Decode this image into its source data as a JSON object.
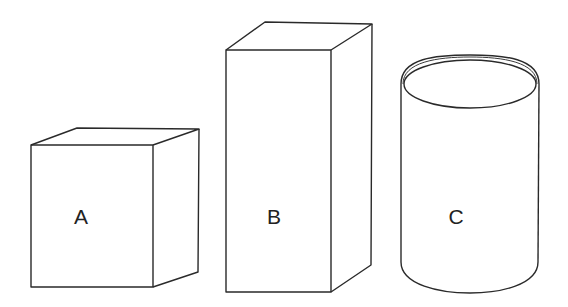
{
  "figure": {
    "shapes": [
      {
        "id": "A",
        "label": "A",
        "type": "cube"
      },
      {
        "id": "B",
        "label": "B",
        "type": "rectangular-prism"
      },
      {
        "id": "C",
        "label": "C",
        "type": "cylinder"
      }
    ],
    "colors": {
      "stroke": "#2a2a2a",
      "background": "#ffffff"
    }
  }
}
